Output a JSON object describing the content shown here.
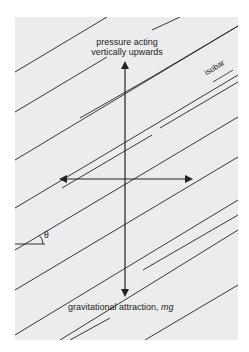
{
  "diagram": {
    "labels": {
      "top_line1": "pressure acting",
      "top_line2": "vertically upwards",
      "isobar": "isobar",
      "theta": "θ",
      "bottom_prefix": "gravitational attraction, ",
      "bottom_italic": "mg"
    },
    "colors": {
      "panel": "#ececec",
      "line": "#222222",
      "background": "#ffffff"
    },
    "panel": {
      "x": 15,
      "y": 17,
      "w": 223,
      "h": 323
    },
    "isobars": [
      [
        15,
        72,
        107,
        17
      ],
      [
        15,
        112,
        107,
        57
      ],
      [
        62,
        188,
        152,
        135
      ],
      [
        160,
        128,
        238,
        82
      ],
      [
        152,
        30,
        180,
        17
      ],
      [
        80,
        118,
        150,
        78
      ],
      [
        150,
        78,
        238,
        26
      ],
      [
        15,
        160,
        238,
        26
      ],
      [
        15,
        208,
        238,
        75
      ],
      [
        15,
        250,
        238,
        117
      ],
      [
        15,
        290,
        238,
        157
      ],
      [
        15,
        335,
        238,
        200
      ],
      [
        60,
        340,
        238,
        230
      ],
      [
        143,
        270,
        238,
        215
      ],
      [
        70,
        340,
        110,
        318
      ],
      [
        145,
        340,
        238,
        285
      ]
    ],
    "arrows": {
      "vertical": {
        "x": 125,
        "y1": 62,
        "y2": 296
      },
      "horizontal": {
        "y": 179,
        "x1": 60,
        "x2": 192
      }
    },
    "angle_marker": {
      "x": 15,
      "y": 244,
      "len": 30
    }
  }
}
